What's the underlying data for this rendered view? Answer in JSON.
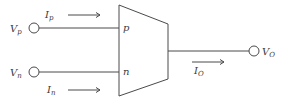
{
  "diagram": {
    "type": "block-diagram",
    "colors": {
      "line": "#4a4a4a",
      "text": "#3a3a3a",
      "background": "#ffffff"
    },
    "inputs": [
      {
        "id": "vp",
        "terminal_symbol": "V",
        "terminal_sub": "p",
        "pin_label": "p",
        "current_symbol": "I",
        "current_sub": "p"
      },
      {
        "id": "vn",
        "terminal_symbol": "V",
        "terminal_sub": "n",
        "pin_label": "n",
        "current_symbol": "I",
        "current_sub": "n"
      }
    ],
    "output": {
      "terminal_symbol": "V",
      "terminal_sub": "O",
      "current_symbol": "I",
      "current_sub": "O"
    }
  }
}
